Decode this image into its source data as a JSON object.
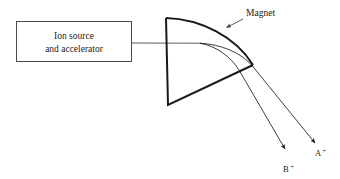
{
  "figure": {
    "kind": "mass-spectrometer-schematic",
    "background_color": "#ffffff",
    "line_color": "#1a1a1a",
    "box_border_color": "#4a4a4a",
    "beam_color": "#3a3a3a"
  },
  "source_box": {
    "line1": "Ion source",
    "line2": "and accelerator",
    "x": 16,
    "y": 21,
    "width": 116,
    "height": 41
  },
  "magnet": {
    "label": "Magnet",
    "label_x": 246,
    "label_y": 16,
    "leader_from_x": 243,
    "leader_from_y": 19,
    "leader_to_x": 224,
    "leader_to_y": 29,
    "top_left_x": 166,
    "top_left_y": 18,
    "bottom_vertex_x": 168,
    "bottom_vertex_y": 105,
    "right_vertex_x": 253,
    "right_vertex_y": 65
  },
  "beams": [
    {
      "id": "beam-a",
      "label": "A",
      "charge": "+",
      "label_x": 321,
      "label_y": 154,
      "arrow_tip_x": 318,
      "arrow_tip_y": 146
    },
    {
      "id": "beam-b",
      "label": "B",
      "charge": "+",
      "label_x": 289,
      "label_y": 170,
      "arrow_tip_x": 288,
      "arrow_tip_y": 152
    }
  ],
  "incoming_beam": {
    "from_x": 132,
    "from_y": 43,
    "to_x": 200,
    "to_y": 43
  }
}
